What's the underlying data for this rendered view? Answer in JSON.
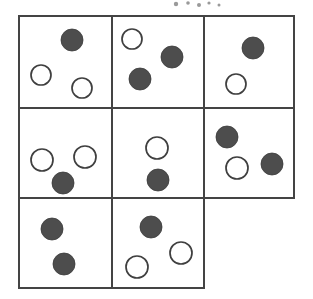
{
  "figure": {
    "title": "",
    "caption": "",
    "kind": "grid-of-cells-with-circles",
    "background_color": "#ffffff",
    "line_color": "#444444",
    "filled_circle_color": "#4d4d4d",
    "open_circle_color": "#ffffff",
    "open_circle_stroke": "#3f3f3f",
    "grid": {
      "rows": 3,
      "cols": 3,
      "cells_present": 8,
      "missing_cell": "row-3-col-3",
      "x_lines": [
        19,
        112,
        204,
        294
      ],
      "y_lines": [
        16,
        108,
        198,
        288
      ],
      "bottom_row_right_edge": 204
    },
    "cells": [
      {
        "id": "cell-r1c1",
        "row": 1,
        "col": 1,
        "x": 19,
        "y": 16,
        "w": 93,
        "h": 92,
        "filled_count": 1,
        "open_count": 2,
        "circles": [
          {
            "type": "filled",
            "cx": 72,
            "cy": 40,
            "r": 11
          },
          {
            "type": "open",
            "cx": 41,
            "cy": 75,
            "r": 10
          },
          {
            "type": "open",
            "cx": 82,
            "cy": 88,
            "r": 10
          }
        ]
      },
      {
        "id": "cell-r1c2",
        "row": 1,
        "col": 2,
        "x": 112,
        "y": 16,
        "w": 92,
        "h": 92,
        "filled_count": 2,
        "open_count": 1,
        "circles": [
          {
            "type": "open",
            "cx": 132,
            "cy": 39,
            "r": 10
          },
          {
            "type": "filled",
            "cx": 172,
            "cy": 57,
            "r": 11
          },
          {
            "type": "filled",
            "cx": 140,
            "cy": 79,
            "r": 11
          }
        ]
      },
      {
        "id": "cell-r1c3",
        "row": 1,
        "col": 3,
        "x": 204,
        "y": 16,
        "w": 90,
        "h": 92,
        "filled_count": 1,
        "open_count": 1,
        "circles": [
          {
            "type": "filled",
            "cx": 253,
            "cy": 48,
            "r": 11
          },
          {
            "type": "open",
            "cx": 236,
            "cy": 84,
            "r": 10
          }
        ]
      },
      {
        "id": "cell-r2c1",
        "row": 2,
        "col": 1,
        "x": 19,
        "y": 108,
        "w": 93,
        "h": 90,
        "filled_count": 1,
        "open_count": 2,
        "circles": [
          {
            "type": "open",
            "cx": 42,
            "cy": 160,
            "r": 11
          },
          {
            "type": "open",
            "cx": 85,
            "cy": 157,
            "r": 11
          },
          {
            "type": "filled",
            "cx": 63,
            "cy": 183,
            "r": 11
          }
        ]
      },
      {
        "id": "cell-r2c2",
        "row": 2,
        "col": 2,
        "x": 112,
        "y": 108,
        "w": 92,
        "h": 90,
        "filled_count": 1,
        "open_count": 1,
        "circles": [
          {
            "type": "open",
            "cx": 157,
            "cy": 148,
            "r": 11
          },
          {
            "type": "filled",
            "cx": 158,
            "cy": 180,
            "r": 11
          }
        ]
      },
      {
        "id": "cell-r2c3",
        "row": 2,
        "col": 3,
        "x": 204,
        "y": 108,
        "w": 90,
        "h": 90,
        "filled_count": 2,
        "open_count": 1,
        "circles": [
          {
            "type": "filled",
            "cx": 227,
            "cy": 137,
            "r": 11
          },
          {
            "type": "open",
            "cx": 237,
            "cy": 168,
            "r": 11
          },
          {
            "type": "filled",
            "cx": 272,
            "cy": 164,
            "r": 11
          }
        ]
      },
      {
        "id": "cell-r3c1",
        "row": 3,
        "col": 1,
        "x": 19,
        "y": 198,
        "w": 93,
        "h": 90,
        "filled_count": 2,
        "open_count": 0,
        "circles": [
          {
            "type": "filled",
            "cx": 52,
            "cy": 229,
            "r": 11
          },
          {
            "type": "filled",
            "cx": 64,
            "cy": 264,
            "r": 11
          }
        ]
      },
      {
        "id": "cell-r3c2",
        "row": 3,
        "col": 2,
        "x": 112,
        "y": 198,
        "w": 92,
        "h": 90,
        "filled_count": 1,
        "open_count": 2,
        "circles": [
          {
            "type": "filled",
            "cx": 151,
            "cy": 227,
            "r": 11
          },
          {
            "type": "open",
            "cx": 181,
            "cy": 253,
            "r": 11
          },
          {
            "type": "open",
            "cx": 137,
            "cy": 267,
            "r": 11
          }
        ]
      }
    ],
    "totals": {
      "filled": 11,
      "open": 10,
      "all_circles": 21
    },
    "specks": [
      {
        "cx": 176,
        "cy": 4,
        "r": 2.2
      },
      {
        "cx": 188,
        "cy": 3,
        "r": 1.8
      },
      {
        "cx": 199,
        "cy": 5,
        "r": 2.0
      },
      {
        "cx": 209,
        "cy": 3,
        "r": 1.6
      },
      {
        "cx": 219,
        "cy": 5,
        "r": 1.5
      }
    ]
  }
}
